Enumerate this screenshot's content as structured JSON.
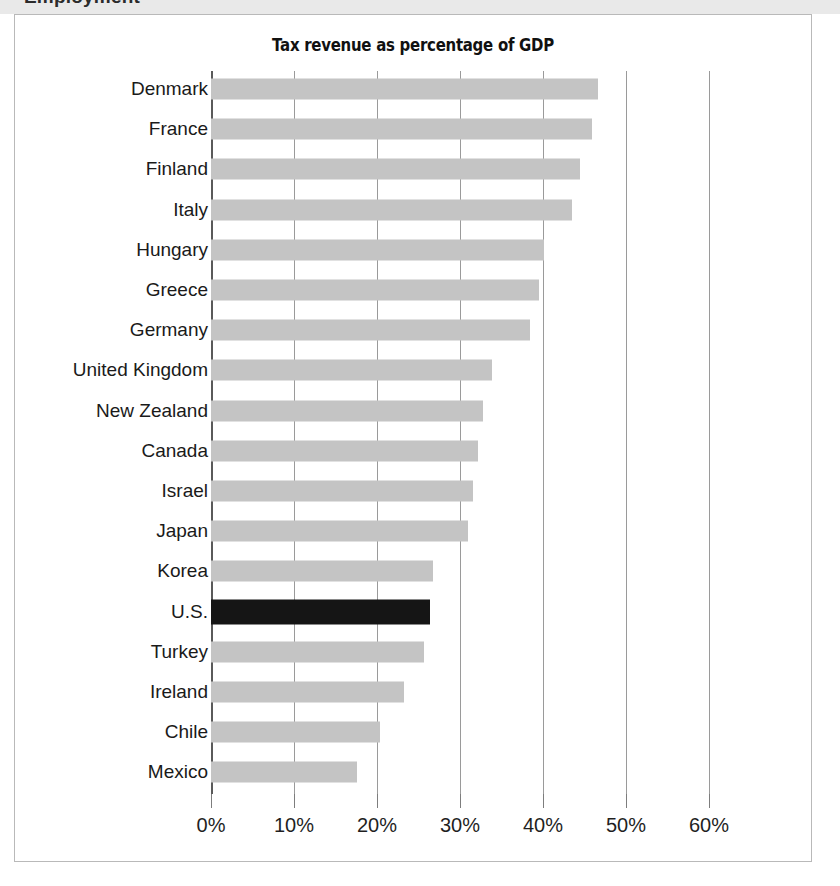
{
  "page": {
    "cut_off_header_text": "Employment"
  },
  "figure": {
    "title": "Tax revenue as percentage of GDP",
    "bar_color": "#c4c4c4",
    "highlight_color": "#151515",
    "gridline_color": "#9a9a9a",
    "axis_color": "#5a5a5a"
  },
  "chart_data": {
    "type": "bar",
    "orientation": "horizontal",
    "title": "Tax revenue as percentage of GDP",
    "xlabel": "",
    "ylabel": "",
    "xlim": [
      0,
      62
    ],
    "grid": true,
    "legend": "none",
    "highlight_category": "U.S.",
    "tick_labels": [
      "0%",
      "10%",
      "20%",
      "30%",
      "40%",
      "50%",
      "60%"
    ],
    "tick_values": [
      0,
      10,
      20,
      30,
      40,
      50,
      60
    ],
    "categories": [
      "Denmark",
      "France",
      "Finland",
      "Italy",
      "Hungary",
      "Greece",
      "Germany",
      "United Kingdom",
      "New Zealand",
      "Canada",
      "Israel",
      "Japan",
      "Korea",
      "U.S.",
      "Turkey",
      "Ireland",
      "Chile",
      "Mexico"
    ],
    "values": [
      46.6,
      45.9,
      44.4,
      43.5,
      40.1,
      39.5,
      38.4,
      33.8,
      32.8,
      32.2,
      31.6,
      31.0,
      26.8,
      26.4,
      25.7,
      23.2,
      20.4,
      17.6
    ],
    "bars": [
      {
        "label": "Denmark",
        "value": 46.6,
        "highlight": false
      },
      {
        "label": "France",
        "value": 45.9,
        "highlight": false
      },
      {
        "label": "Finland",
        "value": 44.4,
        "highlight": false
      },
      {
        "label": "Italy",
        "value": 43.5,
        "highlight": false
      },
      {
        "label": "Hungary",
        "value": 40.1,
        "highlight": false
      },
      {
        "label": "Greece",
        "value": 39.5,
        "highlight": false
      },
      {
        "label": "Germany",
        "value": 38.4,
        "highlight": false
      },
      {
        "label": "United Kingdom",
        "value": 33.8,
        "highlight": false
      },
      {
        "label": "New Zealand",
        "value": 32.8,
        "highlight": false
      },
      {
        "label": "Canada",
        "value": 32.2,
        "highlight": false
      },
      {
        "label": "Israel",
        "value": 31.6,
        "highlight": false
      },
      {
        "label": "Japan",
        "value": 31.0,
        "highlight": false
      },
      {
        "label": "Korea",
        "value": 26.8,
        "highlight": false
      },
      {
        "label": "U.S.",
        "value": 26.4,
        "highlight": true
      },
      {
        "label": "Turkey",
        "value": 25.7,
        "highlight": false
      },
      {
        "label": "Ireland",
        "value": 23.2,
        "highlight": false
      },
      {
        "label": "Chile",
        "value": 20.4,
        "highlight": false
      },
      {
        "label": "Mexico",
        "value": 17.6,
        "highlight": false
      }
    ]
  }
}
